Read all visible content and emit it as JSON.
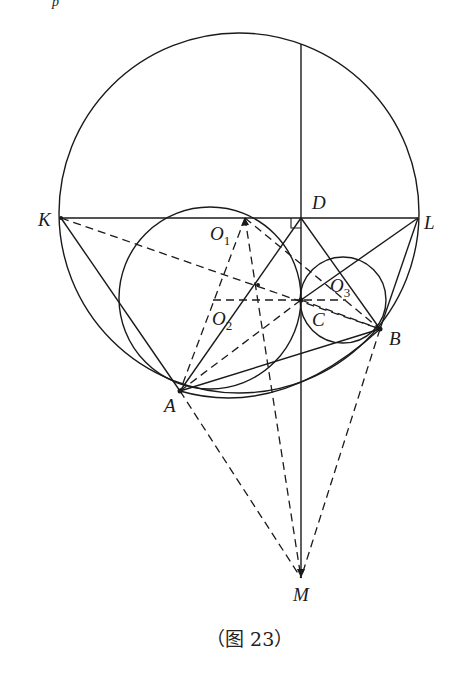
{
  "figure": {
    "caption": "（图 23）",
    "top_fragment": "p"
  },
  "points": {
    "K": {
      "label": "K",
      "x": 61,
      "y": 218
    },
    "L": {
      "label": "L",
      "x": 418,
      "y": 218
    },
    "D": {
      "label": "D",
      "x": 301,
      "y": 218
    },
    "O1": {
      "label": "O",
      "sub": "1",
      "x": 245,
      "y": 218
    },
    "O2": {
      "label": "O",
      "sub": "2",
      "x": 213,
      "y": 300
    },
    "O3": {
      "label": "O",
      "sub": "3",
      "x": 346,
      "y": 300
    },
    "C": {
      "label": "C",
      "x": 301,
      "y": 300
    },
    "B": {
      "label": "B",
      "x": 380,
      "y": 329
    },
    "A": {
      "label": "A",
      "x": 180,
      "y": 391
    },
    "M": {
      "label": "M",
      "x": 301,
      "y": 578
    }
  },
  "circles": [
    {
      "name": "big-circle",
      "cx": 239,
      "cy": 213,
      "r": 180
    },
    {
      "name": "circle-o2",
      "cx": 210,
      "cy": 298,
      "r": 91
    },
    {
      "name": "circle-o3",
      "cx": 343,
      "cy": 300,
      "r": 43
    }
  ]
}
